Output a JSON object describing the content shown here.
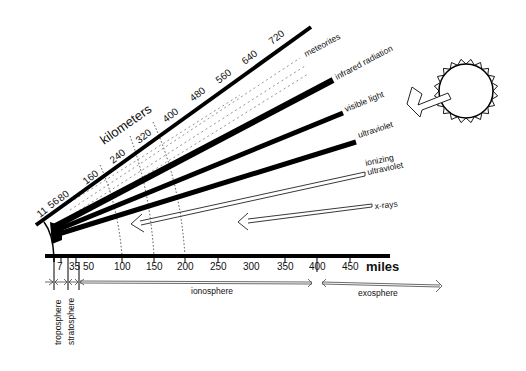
{
  "diagram": {
    "km_axis": {
      "title": "kilometers",
      "ticks": [
        "11",
        "56",
        "80",
        "160",
        "240",
        "320",
        "400",
        "480",
        "560",
        "640",
        "720"
      ]
    },
    "miles_axis": {
      "title": "miles",
      "ticks": [
        "7",
        "35",
        "50",
        "100",
        "150",
        "200",
        "250",
        "300",
        "350",
        "400",
        "450"
      ]
    },
    "rays": [
      {
        "label": "meteorites",
        "style": "dotted"
      },
      {
        "label": "infrared radiation",
        "style": "thick"
      },
      {
        "label": "visible light",
        "style": "thick"
      },
      {
        "label": "ultraviolet",
        "style": "thick"
      },
      {
        "label_line1": "ionizing",
        "label_line2": "ultraviolet",
        "style": "hollow-arrow"
      },
      {
        "label": "x-rays",
        "style": "hollow-arrow"
      }
    ],
    "layers": [
      {
        "label": "troposphere"
      },
      {
        "label": "stratosphere"
      },
      {
        "label": "ionosphere"
      },
      {
        "label": "exosphere"
      }
    ],
    "sun": {
      "icon": "sun-icon"
    }
  }
}
